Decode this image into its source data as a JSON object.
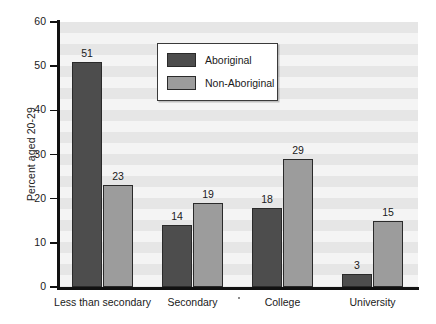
{
  "chart_data": {
    "type": "bar",
    "title": "",
    "subtitle": "",
    "xlabel": "",
    "ylabel": "Percent aged 20-29",
    "categories": [
      "Less than secondary",
      "Secondary",
      "College",
      "University"
    ],
    "series": [
      {
        "name": "Aboriginal",
        "values": [
          51,
          14,
          18,
          3
        ],
        "color": "#4d4d4d"
      },
      {
        "name": "Non-Aboriginal",
        "values": [
          23,
          19,
          29,
          15
        ],
        "color": "#9c9c9c"
      }
    ],
    "ylim": [
      0,
      60
    ],
    "yticks": [
      0,
      10,
      20,
      30,
      40,
      50,
      60
    ],
    "ytick_labels": [
      "0",
      "10",
      "20",
      "30",
      "40",
      "50",
      "60"
    ],
    "grid": "horizontal-bands",
    "legend_position": "top-center",
    "data_labels": true,
    "plot_background": "#f4f4f4",
    "band_color": "#e6e6e6",
    "axis_color": "#111111"
  },
  "legend": {
    "entries": [
      {
        "label": "Aboriginal"
      },
      {
        "label": "Non-Aboriginal"
      }
    ]
  }
}
